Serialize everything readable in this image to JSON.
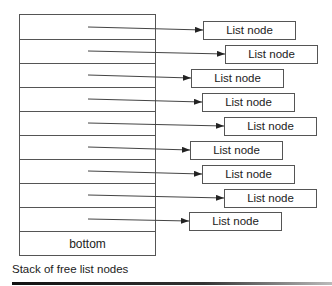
{
  "diagram": {
    "title": "Stack of free list nodes",
    "stack": {
      "rows": [
        {
          "label": "",
          "points_to": 0
        },
        {
          "label": "",
          "points_to": 1
        },
        {
          "label": "",
          "points_to": 2
        },
        {
          "label": "",
          "points_to": 3
        },
        {
          "label": "",
          "points_to": 4
        },
        {
          "label": "",
          "points_to": 5
        },
        {
          "label": "",
          "points_to": 6
        },
        {
          "label": "",
          "points_to": 7
        },
        {
          "label": "",
          "points_to": 8
        },
        {
          "label": "bottom"
        }
      ],
      "bottom_label": "bottom"
    },
    "nodes": [
      {
        "label": "List node",
        "x": 203,
        "y": 21
      },
      {
        "label": "List node",
        "x": 225,
        "y": 45
      },
      {
        "label": "List node",
        "x": 191,
        "y": 69
      },
      {
        "label": "List node",
        "x": 202,
        "y": 93
      },
      {
        "label": "List node",
        "x": 224,
        "y": 117
      },
      {
        "label": "List node",
        "x": 190,
        "y": 141
      },
      {
        "label": "List node",
        "x": 202,
        "y": 165
      },
      {
        "label": "List node",
        "x": 224,
        "y": 189
      },
      {
        "label": "List node",
        "x": 189,
        "y": 212
      }
    ],
    "colors": {
      "line": "#555555",
      "arrow": "#222222",
      "background": "#ffffff"
    }
  }
}
